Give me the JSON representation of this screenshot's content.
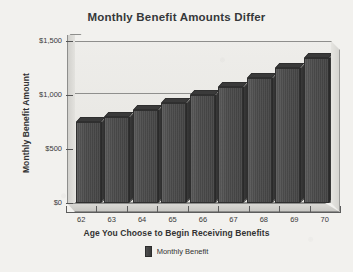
{
  "chart_data": {
    "type": "bar",
    "title": "Monthly Benefit Amounts Differ",
    "xlabel": "Age You Choose to Begin Receiving Benefits",
    "ylabel": "Monthly Benefit Amount",
    "categories": [
      "62",
      "63",
      "64",
      "65",
      "66",
      "67",
      "68",
      "69",
      "70"
    ],
    "values": [
      750,
      800,
      860,
      925,
      1000,
      1075,
      1160,
      1250,
      1340
    ],
    "series": [
      {
        "name": "Monthly Benefit",
        "values": [
          750,
          800,
          860,
          925,
          1000,
          1075,
          1160,
          1250,
          1340
        ]
      }
    ],
    "ylim": [
      0,
      1500
    ],
    "ytick_values": [
      0,
      500,
      1000,
      1500
    ],
    "ytick_labels": [
      "$0",
      "$500",
      "$1,000",
      "$1,500"
    ],
    "grid": true,
    "gridlines_at": [
      500,
      1000
    ],
    "legend": [
      "Monthly Benefit"
    ],
    "legend_position": "bottom-center",
    "bar_color": "#4a4a4a",
    "plot_background": "#eceae7",
    "style": "3d-perspective"
  },
  "axis": {
    "y_labels": [
      "$1,500",
      "$1,000",
      "$500",
      "$0"
    ],
    "x_labels": [
      "62",
      "63",
      "64",
      "65",
      "66",
      "67",
      "68",
      "69",
      "70"
    ]
  },
  "legend": {
    "items": [
      {
        "label": "Monthly Benefit",
        "color": "#4a4a4a"
      }
    ]
  }
}
